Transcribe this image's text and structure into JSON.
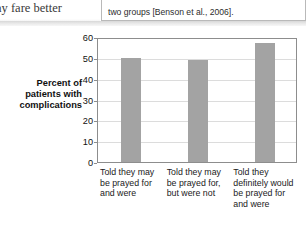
{
  "page": {
    "left_running_text": "ay fare better",
    "callout_text": "two groups [Benson et al., 2006]."
  },
  "chart_data": {
    "type": "bar",
    "title": "",
    "xlabel": "",
    "ylabel": "Percent of patients with complications",
    "categories": [
      "Told they may be prayed for and were",
      "Told they may be prayed for, but were not",
      "Told they definitely would be prayed for and were"
    ],
    "values": [
      50,
      49,
      57
    ],
    "ylim": [
      0,
      60
    ],
    "yticks": [
      0,
      10,
      20,
      30,
      40,
      50,
      60
    ],
    "ytick_labels": [
      "0",
      "10",
      "20",
      "30",
      "40",
      "50",
      "60"
    ],
    "grid": true,
    "legend": "none",
    "bar_color": "#a3a3a3",
    "axis_color": "#8d8d8d",
    "gridline_color": "#dcdcdc"
  }
}
